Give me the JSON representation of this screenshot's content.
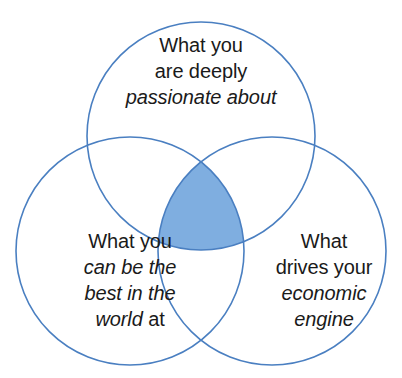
{
  "diagram": {
    "type": "venn-3-circle",
    "background_color": "#ffffff",
    "stroke_color": "#4a7fc1",
    "intersection_fill_color": "#7faee0",
    "text_color": "#1a1a1a",
    "circles": [
      {
        "id": "passion",
        "cx": 201,
        "cy": 136,
        "r": 114
      },
      {
        "id": "best",
        "cx": 130,
        "cy": 251,
        "r": 114
      },
      {
        "id": "economic",
        "cx": 272,
        "cy": 251,
        "r": 114
      }
    ],
    "labels": {
      "passion": {
        "id": "passion",
        "lines": [
          {
            "text": "What you",
            "italic": false
          },
          {
            "text": "are deeply",
            "italic": false
          },
          {
            "text": "passionate about",
            "italic": true
          }
        ],
        "plain_text": "What you are deeply passionate about"
      },
      "best": {
        "id": "best",
        "lines": [
          {
            "text": "What you",
            "italic": false
          },
          {
            "text": "can be the",
            "italic": true
          },
          {
            "text": "best in the",
            "italic": true
          },
          {
            "text": "world at",
            "italic": "mixed",
            "italic_part": "world",
            "roman_part": "at"
          }
        ],
        "plain_text": "What you can be the best in the world at"
      },
      "economic": {
        "id": "economic",
        "lines": [
          {
            "text": "What",
            "italic": false
          },
          {
            "text": "drives your",
            "italic": false
          },
          {
            "text": "economic",
            "italic": true
          },
          {
            "text": "engine",
            "italic": true
          }
        ],
        "plain_text": "What drives your economic engine"
      }
    },
    "label_text": {
      "passion_line_1": "What you",
      "passion_line_2": "are deeply",
      "passion_line_3": "passionate about",
      "best_line_1": "What you",
      "best_line_2": "can be the",
      "best_line_3": "best in the",
      "best_line_4_italic": "world",
      "best_line_4_roman": " at",
      "economic_line_1": "What",
      "economic_line_2": "drives your",
      "economic_line_3": "economic",
      "economic_line_4": "engine"
    }
  }
}
